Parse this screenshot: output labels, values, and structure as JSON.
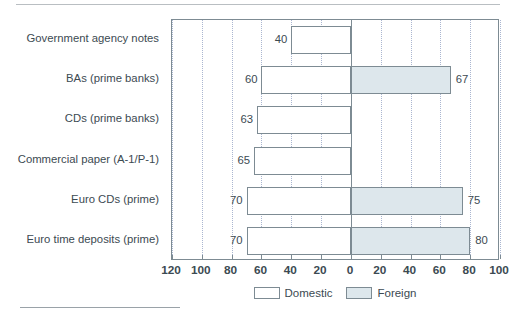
{
  "chart_data": {
    "type": "bar",
    "orientation": "horizontal",
    "subtype": "diverging-bidirectional",
    "title": "",
    "xlabel": "",
    "ylabel": "",
    "categories": [
      "Government agency notes",
      "BAs (prime banks)",
      "CDs (prime banks)",
      "Commercial paper (A-1/P-1)",
      "Euro CDs (prime)",
      "Euro time deposits (prime)"
    ],
    "series": [
      {
        "name": "Domestic",
        "direction": "left",
        "color": "#ffffff",
        "values": [
          40,
          60,
          63,
          65,
          70,
          70
        ]
      },
      {
        "name": "Foreign",
        "direction": "right",
        "color": "#dde7ec",
        "values": [
          0,
          67,
          0,
          0,
          75,
          80
        ]
      }
    ],
    "data_labels": {
      "left": [
        "40",
        "60",
        "63",
        "65",
        "70",
        "70"
      ],
      "right": [
        "",
        "67",
        "",
        "",
        "75",
        "80"
      ]
    },
    "axis": {
      "left_max": 120,
      "right_max": 100,
      "zero_position_value": 0,
      "tick_values": [
        120,
        100,
        80,
        60,
        40,
        20,
        0,
        20,
        40,
        60,
        80,
        100
      ],
      "tick_labels": [
        "120",
        "100",
        "80",
        "60",
        "40",
        "20",
        "0",
        "20",
        "40",
        "60",
        "80",
        "100"
      ],
      "grid": true,
      "grid_style": "dotted"
    },
    "legend": {
      "position": "bottom-center",
      "entries": [
        {
          "label": "Domestic",
          "swatch": "#ffffff"
        },
        {
          "label": "Foreign",
          "swatch": "#dde7ec"
        }
      ]
    }
  },
  "legend": {
    "domestic_label": "Domestic",
    "foreign_label": "Foreign"
  }
}
